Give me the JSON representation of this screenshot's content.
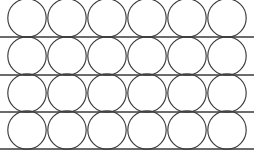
{
  "figure": {
    "name": "circle-lattice-pattern",
    "width": 254,
    "height": 160,
    "background_color": "#ffffff",
    "stroke_color": "#3a3a3a"
  },
  "chart_data": {
    "type": "scatter",
    "title": "",
    "subtitle": "",
    "xlabel": "",
    "ylabel": "",
    "grid": true,
    "legend_position": "none",
    "xlim": [
      0,
      254
    ],
    "ylim": [
      0,
      160
    ],
    "tick_labels_x": [],
    "tick_labels_y": [],
    "annotations": [],
    "geometry": {
      "shape": "circle",
      "circle_radius": 19.2,
      "circle_diameter": 38.4,
      "column_centers_x": [
        27,
        67,
        107,
        147,
        187,
        227
      ],
      "row_centers_y": [
        18,
        56,
        93,
        130
      ],
      "column_spacing": 40,
      "row_spacing": 37.5,
      "circle_stroke_width": 1.15
    },
    "horizontal_lines": {
      "count": 4,
      "y_values": [
        37,
        75,
        112,
        149
      ],
      "x_start": 0,
      "x_end": 254,
      "stroke_width": 1.35
    },
    "series": [
      {
        "name": "circle-centers",
        "values": [
          [
            27,
            18
          ],
          [
            67,
            18
          ],
          [
            107,
            18
          ],
          [
            147,
            18
          ],
          [
            187,
            18
          ],
          [
            227,
            18
          ],
          [
            27,
            56
          ],
          [
            67,
            56
          ],
          [
            107,
            56
          ],
          [
            147,
            56
          ],
          [
            187,
            56
          ],
          [
            227,
            56
          ],
          [
            27,
            93
          ],
          [
            67,
            93
          ],
          [
            107,
            93
          ],
          [
            147,
            93
          ],
          [
            187,
            93
          ],
          [
            227,
            93
          ],
          [
            27,
            130
          ],
          [
            67,
            130
          ],
          [
            107,
            130
          ],
          [
            147,
            130
          ],
          [
            187,
            130
          ],
          [
            227,
            130
          ]
        ]
      }
    ]
  }
}
